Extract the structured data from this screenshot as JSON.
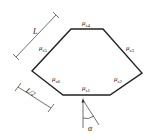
{
  "diagram": {
    "type": "polygon-with-dimensions",
    "edges": [
      {
        "id": "s4",
        "symbol": "μ",
        "subscript": "s4",
        "position": "top"
      },
      {
        "id": "s3",
        "symbol": "μ",
        "subscript": "s3",
        "position": "upper-right"
      },
      {
        "id": "s2",
        "symbol": "μ",
        "subscript": "s2",
        "position": "lower-right"
      },
      {
        "id": "s1",
        "symbol": "μ",
        "subscript": "s1",
        "position": "bottom"
      },
      {
        "id": "s6",
        "symbol": "μ",
        "subscript": "s6",
        "position": "lower-left"
      },
      {
        "id": "s5",
        "symbol": "μ",
        "subscript": "s5",
        "position": "upper-left"
      }
    ],
    "dimensions": {
      "long": "L",
      "half": "L/2"
    },
    "angle": {
      "label": "α"
    },
    "colors": {
      "stroke": "#222222",
      "background": "#ffffff"
    }
  }
}
